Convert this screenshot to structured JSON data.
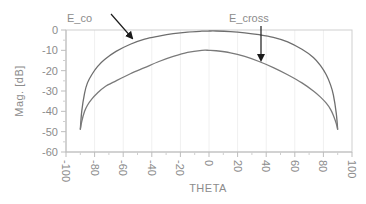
{
  "chart_data": {
    "type": "line",
    "title": "",
    "xlabel": "THETA",
    "ylabel": "Mag. [dB]",
    "xlim": [
      -100,
      100
    ],
    "ylim": [
      -60,
      0
    ],
    "xticks": [
      -100,
      -80,
      -60,
      -40,
      -20,
      0,
      20,
      40,
      60,
      80,
      100
    ],
    "yticks": [
      0,
      -10,
      -20,
      -30,
      -40,
      -50,
      -60
    ],
    "grid": {
      "vertical": true,
      "horizontal": false
    },
    "legend": "none",
    "series": [
      {
        "name": "E_co",
        "color": "#6e6e6e",
        "x": [
          -90,
          -89,
          -87,
          -85,
          -82,
          -78,
          -73,
          -65,
          -55,
          -45,
          -35,
          -25,
          -15,
          -5,
          0,
          5,
          15,
          25,
          35,
          45,
          55,
          65,
          73,
          78,
          82,
          85,
          87,
          89,
          90
        ],
        "y": [
          -49,
          -40,
          -31,
          -26,
          -22,
          -18,
          -14.5,
          -10.5,
          -7,
          -4.5,
          -3,
          -1.8,
          -1,
          -0.6,
          -0.5,
          -0.5,
          -0.8,
          -1.4,
          -2.3,
          -3.6,
          -5.8,
          -9.5,
          -13.5,
          -17.5,
          -22,
          -27,
          -32,
          -41,
          -49
        ]
      },
      {
        "name": "E_cross",
        "color": "#7a7a7a",
        "x": [
          -90,
          -89,
          -87,
          -85,
          -82,
          -78,
          -73,
          -65,
          -55,
          -45,
          -35,
          -25,
          -15,
          -5,
          0,
          5,
          15,
          25,
          35,
          45,
          55,
          65,
          73,
          78,
          82,
          85,
          87,
          89,
          90
        ],
        "y": [
          -49,
          -45,
          -40,
          -37,
          -34,
          -31,
          -28,
          -25,
          -21.5,
          -18.5,
          -15.5,
          -13,
          -11,
          -10,
          -10,
          -10.2,
          -11.2,
          -13,
          -15.5,
          -18.5,
          -22,
          -26,
          -30,
          -33,
          -36,
          -39,
          -42,
          -46,
          -49
        ]
      }
    ],
    "annotations": [
      {
        "text": "E_co",
        "arrow_to": {
          "x": -52,
          "y": -4.5
        }
      },
      {
        "text": "E_cross",
        "arrow_to": {
          "x": 37,
          "y": -16
        }
      }
    ]
  }
}
